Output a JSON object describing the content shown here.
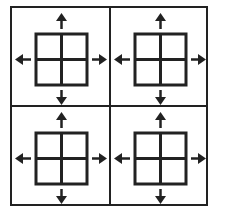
{
  "diagram": {
    "stroke_color": "#222222",
    "background": "#ffffff",
    "cells": [
      {
        "id": "top-left",
        "icon": "grid-2x2-icon",
        "arrows": [
          "up",
          "down",
          "left",
          "right"
        ]
      },
      {
        "id": "top-right",
        "icon": "grid-2x2-icon",
        "arrows": [
          "up",
          "down",
          "left",
          "right"
        ]
      },
      {
        "id": "bottom-left",
        "icon": "grid-2x2-icon",
        "arrows": [
          "up",
          "down",
          "left",
          "right"
        ]
      },
      {
        "id": "bottom-right",
        "icon": "grid-2x2-icon",
        "arrows": [
          "up",
          "down",
          "left",
          "right"
        ]
      }
    ]
  }
}
